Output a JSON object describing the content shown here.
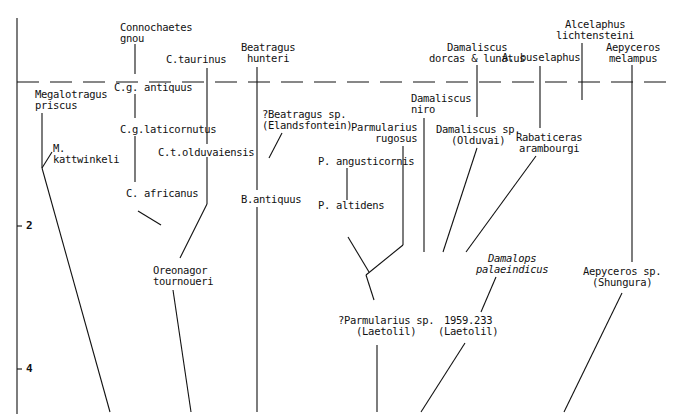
{
  "figure": {
    "type": "phylogeny",
    "time_axis": {
      "ticks": [
        {
          "label": "2"
        },
        {
          "label": "4"
        }
      ]
    },
    "present_line": "dashed"
  },
  "taxa": {
    "megalotragus_priscus": "Megalotragus\npriscus",
    "m_kattwinkeli": "M.\nkattwinkeli",
    "connochaetes_gnou": "Connochaetes\ngnou",
    "cg_antiquus": "C.g. antiquus",
    "cg_laticornutus": "C.g.laticornutus",
    "c_africanus": "C. africanus",
    "c_taurinus": "C.taurinus",
    "ct_olduvaiensis": "C.t.olduvaiensis",
    "oreonagor": "Oreonagor\ntournoueri",
    "beatragus_hunteri": "Beatragus\nhunteri",
    "beatragus_sp": "?Beatragus sp.\n(Elandsfontein)",
    "b_antiquus": "B.antiquus",
    "parmularius_rugosus": "Parmularius\nrugosus",
    "p_angusticornis": "P. angusticornis",
    "p_altidens": "P. altidens",
    "parmularius_sp": "?Parmularius sp.\n(Laetolil)",
    "damaliscus_dl": "Damaliscus\ndorcas & lunatus",
    "damaliscus_niro": "Damaliscus\nniro",
    "damaliscus_sp": "Damaliscus sp.\n(Olduvai)",
    "damalops": "Damalops\npalaeindicus",
    "specimen_1959": "1959.233\n(Laetolil)",
    "a_buselaphus": "A. buselaphus",
    "alcelaphus_l": "Alcelaphus\nlichtensteini",
    "rabaticeras": "Rabaticeras\narambourgi",
    "aepyceros_melampus": "Aepyceros\nmelampus",
    "aepyceros_sp": "Aepyceros sp.\n(Shungura)"
  }
}
